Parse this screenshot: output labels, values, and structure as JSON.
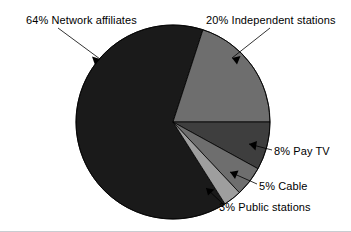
{
  "chart_data": {
    "type": "pie",
    "title": "",
    "subtitle": "",
    "xlabel": "",
    "ylabel": "",
    "legend_position": "none",
    "grid": false,
    "categories": [
      "Independent stations",
      "Network affiliates",
      "Public stations",
      "Cable",
      "Pay TV"
    ],
    "values": [
      20,
      64,
      3,
      5,
      8
    ],
    "units": "percent",
    "total": 100,
    "start_angle_deg": 0,
    "direction": "counterclockwise",
    "slices": [
      {
        "label": "20% Independent stations",
        "name": "Independent stations",
        "value": 20,
        "value_text": "20%",
        "color": "#6e6e6e",
        "start_deg": 0,
        "end_deg": 72
      },
      {
        "label": "64% Network affiliates",
        "name": "Network affiliates",
        "value": 64,
        "value_text": "64%",
        "color": "#1a1a1a",
        "start_deg": 72,
        "end_deg": 302.4
      },
      {
        "label": "3% Public stations",
        "name": "Public stations",
        "value": 3,
        "value_text": "3%",
        "color": "#9e9e9e",
        "start_deg": 302.4,
        "end_deg": 313.2
      },
      {
        "label": "5% Cable",
        "name": "Cable",
        "value": 5,
        "value_text": "5%",
        "color": "#6e6e6e",
        "start_deg": 313.2,
        "end_deg": 331.2
      },
      {
        "label": "8% Pay TV",
        "name": "Pay TV",
        "value": 8,
        "value_text": "8%",
        "color": "#3e3e3e",
        "start_deg": 331.2,
        "end_deg": 360
      }
    ],
    "geometry": {
      "center_x": 173,
      "center_y": 122,
      "radius": 97
    },
    "colors": {
      "network_affiliates": "#1a1a1a",
      "independent_stations": "#6e6e6e",
      "pay_tv": "#3e3e3e",
      "cable": "#6e6e6e",
      "public_stations": "#9e9e9e",
      "outline": "#000000",
      "background": "#ffffff",
      "rule": "#c9ccd1"
    }
  },
  "labels": {
    "network": "64% Network affiliates",
    "independent": "20% Independent stations",
    "paytv": "8% Pay TV",
    "cable": "5% Cable",
    "public": "3% Public stations"
  }
}
